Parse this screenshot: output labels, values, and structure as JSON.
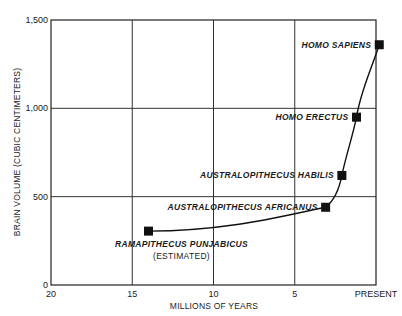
{
  "chart_data": {
    "type": "line",
    "title": "",
    "xlabel": "MILLIONS OF YEARS",
    "ylabel": "BRAIN VOLUME (CUBIC CENTIMETERS)",
    "x_ticks": [
      {
        "value": 20,
        "label": "20"
      },
      {
        "value": 15,
        "label": "15"
      },
      {
        "value": 10,
        "label": "10"
      },
      {
        "value": 5,
        "label": "5"
      },
      {
        "value": 0,
        "label": "PRESENT"
      }
    ],
    "y_ticks": [
      {
        "value": 0,
        "label": "0"
      },
      {
        "value": 500,
        "label": "500"
      },
      {
        "value": 1000,
        "label": "1,000"
      },
      {
        "value": 1500,
        "label": "1,500"
      }
    ],
    "xlim": [
      20,
      0
    ],
    "ylim": [
      0,
      1500
    ],
    "grid": true,
    "legend": "none",
    "series": [
      {
        "name": "Hominid brain volume",
        "points": [
          {
            "species": "RAMAPITHECUS PUNJABICUS",
            "note": "(ESTIMATED)",
            "mya": 14,
            "cc": 305
          },
          {
            "species": "AUSTRALOPITHECUS AFRICANUS",
            "note": "",
            "mya": 3.1,
            "cc": 440
          },
          {
            "species": "AUSTRALOPITHECUS HABILIS",
            "note": "",
            "mya": 2.1,
            "cc": 620
          },
          {
            "species": "HOMO ERECTUS",
            "note": "",
            "mya": 1.2,
            "cc": 950
          },
          {
            "species": "HOMO SAPIENS",
            "note": "",
            "mya": -0.2,
            "cc": 1360
          }
        ]
      }
    ]
  }
}
